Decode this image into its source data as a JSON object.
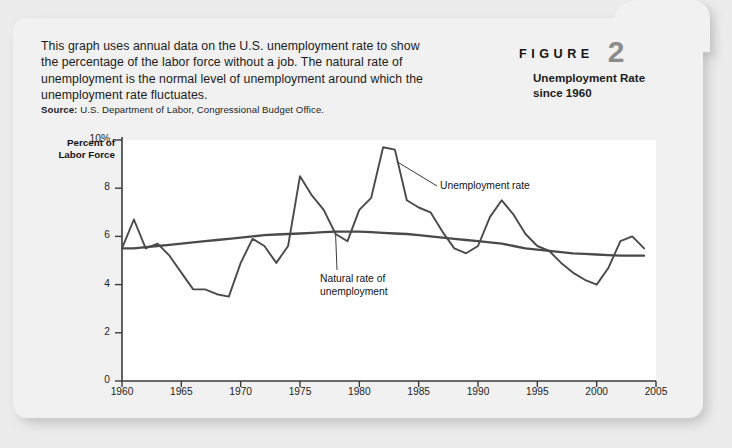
{
  "figure": {
    "label": "FIGURE",
    "number": "2",
    "subtitle": "Unemployment Rate\nsince 1960"
  },
  "intro": "This graph uses annual data on the U.S. unemployment rate to show the percentage of the labor force without a job. The natural rate of unemployment is the normal level of unemployment around which the unemployment rate fluctuates.",
  "source": {
    "label": "Source:",
    "text": "U.S. Department of Labor, Congressional Budget Office."
  },
  "annotations": {
    "unemployment_rate": "Unemployment rate",
    "natural_rate": "Natural rate of\nunemployment"
  },
  "colors": {
    "page_background": "#ececed",
    "card_background": "#f1f1f1",
    "plot_background": "#ffffff",
    "line": "#4a4a4a",
    "axis": "#3a3a3a",
    "figure_number": "#8b8b8b",
    "text": "#1b1b1b"
  },
  "chart_data": {
    "type": "line",
    "title": "Unemployment Rate since 1960",
    "xlabel": "",
    "ylabel": "Percent of Labor Force",
    "xlim": [
      1960,
      2005
    ],
    "ylim": [
      0,
      10
    ],
    "xticks": [
      1960,
      1965,
      1970,
      1975,
      1980,
      1985,
      1990,
      1995,
      2000,
      2005
    ],
    "yticks": [
      0,
      2,
      4,
      6,
      8,
      10
    ],
    "ytick_labels": [
      "0",
      "2",
      "4",
      "6",
      "8",
      "10%"
    ],
    "grid": false,
    "legend": "annotations",
    "x": [
      1960,
      1961,
      1962,
      1963,
      1964,
      1965,
      1966,
      1967,
      1968,
      1969,
      1970,
      1971,
      1972,
      1973,
      1974,
      1975,
      1976,
      1977,
      1978,
      1979,
      1980,
      1981,
      1982,
      1983,
      1984,
      1985,
      1986,
      1987,
      1988,
      1989,
      1990,
      1991,
      1992,
      1993,
      1994,
      1995,
      1996,
      1997,
      1998,
      1999,
      2000,
      2001,
      2002,
      2003,
      2004
    ],
    "series": [
      {
        "name": "Unemployment rate",
        "values": [
          5.5,
          6.7,
          5.5,
          5.7,
          5.2,
          4.5,
          3.8,
          3.8,
          3.6,
          3.5,
          4.9,
          5.9,
          5.6,
          4.9,
          5.6,
          8.5,
          7.7,
          7.1,
          6.1,
          5.8,
          7.1,
          7.6,
          9.7,
          9.6,
          7.5,
          7.2,
          7.0,
          6.2,
          5.5,
          5.3,
          5.6,
          6.8,
          7.5,
          6.9,
          6.1,
          5.6,
          5.4,
          4.9,
          4.5,
          4.2,
          4.0,
          4.7,
          5.8,
          6.0,
          5.5
        ]
      },
      {
        "name": "Natural rate of unemployment",
        "values": [
          5.5,
          5.5,
          5.55,
          5.6,
          5.65,
          5.7,
          5.75,
          5.8,
          5.85,
          5.9,
          5.95,
          6.0,
          6.05,
          6.08,
          6.1,
          6.12,
          6.15,
          6.18,
          6.2,
          6.2,
          6.2,
          6.18,
          6.15,
          6.12,
          6.1,
          6.05,
          6.0,
          5.95,
          5.9,
          5.85,
          5.8,
          5.75,
          5.7,
          5.6,
          5.5,
          5.45,
          5.4,
          5.35,
          5.3,
          5.28,
          5.25,
          5.22,
          5.2,
          5.2,
          5.2
        ]
      }
    ]
  }
}
